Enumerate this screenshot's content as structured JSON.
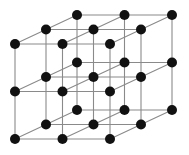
{
  "figure": {
    "background_color": "#ffffff"
  },
  "chart_data": {
    "type": "scatter",
    "xlabel": "",
    "ylabel": "",
    "grid": false,
    "legend_position": "none",
    "lattice": {
      "type": "simple-cubic",
      "nx": 3,
      "ny": 3,
      "nz": 3,
      "node_count": 27,
      "edge_count": 54,
      "projection": "oblique",
      "origin_px": [
        15,
        139
      ],
      "x_step_px": [
        47.5,
        0
      ],
      "y_step_px": [
        0,
        -47.5
      ],
      "z_step_px": [
        31,
        -14.5
      ]
    },
    "style": {
      "node_color": "#111111",
      "node_radius_px": 5,
      "edge_color": "#8a8a8a",
      "edge_width_px": 1.1
    },
    "indices": [
      [
        0,
        0,
        0
      ],
      [
        1,
        0,
        0
      ],
      [
        2,
        0,
        0
      ],
      [
        0,
        0,
        1
      ],
      [
        1,
        0,
        1
      ],
      [
        2,
        0,
        1
      ],
      [
        0,
        0,
        2
      ],
      [
        1,
        0,
        2
      ],
      [
        2,
        0,
        2
      ],
      [
        0,
        1,
        0
      ],
      [
        1,
        1,
        0
      ],
      [
        2,
        1,
        0
      ],
      [
        0,
        1,
        1
      ],
      [
        1,
        1,
        1
      ],
      [
        2,
        1,
        1
      ],
      [
        0,
        1,
        2
      ],
      [
        1,
        1,
        2
      ],
      [
        2,
        1,
        2
      ],
      [
        0,
        2,
        0
      ],
      [
        1,
        2,
        0
      ],
      [
        2,
        2,
        0
      ],
      [
        0,
        2,
        1
      ],
      [
        1,
        2,
        1
      ],
      [
        2,
        2,
        1
      ],
      [
        0,
        2,
        2
      ],
      [
        1,
        2,
        2
      ],
      [
        2,
        2,
        2
      ]
    ]
  }
}
